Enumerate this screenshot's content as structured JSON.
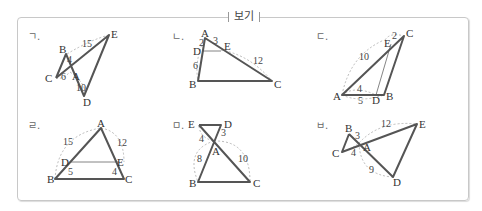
{
  "box": {
    "title": "보기"
  },
  "panels": [
    {
      "marker": "ㄱ.",
      "points": {
        "A": "A",
        "B": "B",
        "C": "C",
        "D": "D",
        "E": "E"
      },
      "lengths": [
        "15",
        "4",
        "6",
        "10"
      ]
    },
    {
      "marker": "ㄴ.",
      "points": {
        "A": "A",
        "B": "B",
        "C": "C",
        "D": "D",
        "E": "E"
      },
      "lengths": [
        "2",
        "3",
        "6",
        "12"
      ]
    },
    {
      "marker": "ㄷ.",
      "points": {
        "A": "A",
        "B": "B",
        "C": "C",
        "D": "D",
        "E": "E"
      },
      "lengths": [
        "2",
        "10",
        "4",
        "5"
      ]
    },
    {
      "marker": "ㄹ.",
      "points": {
        "A": "A",
        "B": "B",
        "C": "C",
        "D": "D",
        "E": "E"
      },
      "lengths": [
        "15",
        "12",
        "5",
        "4"
      ]
    },
    {
      "marker": "ㅁ.",
      "points": {
        "A": "A",
        "B": "B",
        "C": "C",
        "D": "D",
        "E": "E"
      },
      "lengths": [
        "4",
        "3",
        "8",
        "10"
      ]
    },
    {
      "marker": "ㅂ.",
      "points": {
        "A": "A",
        "B": "B",
        "C": "C",
        "D": "D",
        "E": "E"
      },
      "lengths": [
        "3",
        "12",
        "4",
        "9"
      ]
    }
  ]
}
